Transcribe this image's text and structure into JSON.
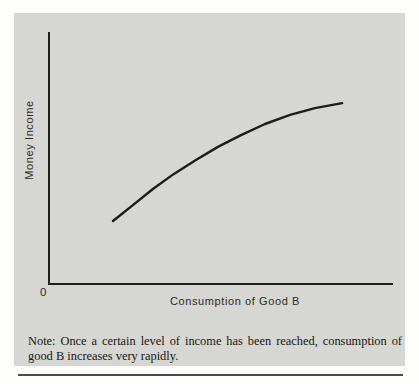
{
  "colors": {
    "page_background": "#fdfdfc",
    "panel_background": "#d6d6d2",
    "axis": "#1f1f1d",
    "curve": "#1c1c1a",
    "label_text": "#2c2c2a",
    "note_text": "#161614",
    "rule": "#4c4c48"
  },
  "chart_data": {
    "type": "line",
    "title": "",
    "xlabel": "Consumption of Good B",
    "ylabel": "Money Income",
    "origin_label": "0",
    "x_tick_labels": [],
    "y_tick_labels": [],
    "grid": false,
    "legend": false,
    "series": [
      {
        "name": "money-income-vs-consumption-of-good-b",
        "points_axis_fraction": [
          [
            0.186,
            0.25
          ],
          [
            0.244,
            0.313
          ],
          [
            0.302,
            0.377
          ],
          [
            0.363,
            0.437
          ],
          [
            0.427,
            0.492
          ],
          [
            0.491,
            0.544
          ],
          [
            0.558,
            0.591
          ],
          [
            0.628,
            0.635
          ],
          [
            0.701,
            0.671
          ],
          [
            0.773,
            0.698
          ],
          [
            0.852,
            0.718
          ]
        ]
      }
    ]
  },
  "note": {
    "line1": "Note: Once a certain level of income has been reached, consumption of",
    "line2": "good B increases very rapidly."
  }
}
